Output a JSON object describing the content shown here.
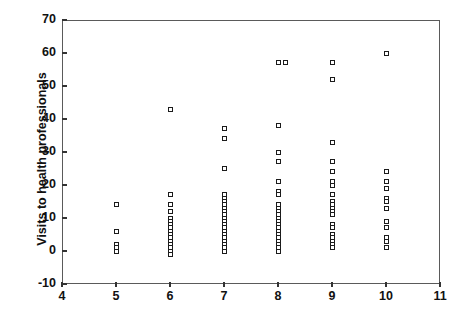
{
  "chart_data": {
    "type": "scatter",
    "title": "",
    "xlabel": "",
    "ylabel": "Visits to health professionals",
    "xlim": [
      4,
      11
    ],
    "ylim": [
      -10,
      70
    ],
    "xticks": [
      4,
      5,
      6,
      7,
      8,
      9,
      10,
      11
    ],
    "yticks": [
      -10,
      0,
      10,
      20,
      30,
      40,
      50,
      60,
      70
    ],
    "grid": false,
    "legend": false,
    "marker": "open-square",
    "marker_color": "#1b1b1b",
    "frame_color": "#5a5a5a",
    "background": "#ffffff",
    "note": "Jittered column scatter; points are stacked at integer x categories 5-10.",
    "points": [
      {
        "x": 5,
        "y": 14
      },
      {
        "x": 5,
        "y": 6
      },
      {
        "x": 5,
        "y": 2
      },
      {
        "x": 5,
        "y": 1
      },
      {
        "x": 5,
        "y": 0
      },
      {
        "x": 6,
        "y": 43
      },
      {
        "x": 6,
        "y": 17
      },
      {
        "x": 6,
        "y": 14
      },
      {
        "x": 6,
        "y": 12
      },
      {
        "x": 6,
        "y": 10
      },
      {
        "x": 6,
        "y": 9
      },
      {
        "x": 6,
        "y": 8
      },
      {
        "x": 6,
        "y": 7
      },
      {
        "x": 6,
        "y": 6
      },
      {
        "x": 6,
        "y": 5
      },
      {
        "x": 6,
        "y": 4
      },
      {
        "x": 6,
        "y": 3
      },
      {
        "x": 6,
        "y": 2
      },
      {
        "x": 6,
        "y": 1
      },
      {
        "x": 6,
        "y": 0
      },
      {
        "x": 6,
        "y": -1
      },
      {
        "x": 7,
        "y": 37
      },
      {
        "x": 7,
        "y": 34
      },
      {
        "x": 7,
        "y": 25
      },
      {
        "x": 7,
        "y": 17
      },
      {
        "x": 7,
        "y": 16
      },
      {
        "x": 7,
        "y": 15
      },
      {
        "x": 7,
        "y": 14
      },
      {
        "x": 7,
        "y": 13
      },
      {
        "x": 7,
        "y": 12
      },
      {
        "x": 7,
        "y": 11
      },
      {
        "x": 7,
        "y": 10
      },
      {
        "x": 7,
        "y": 9
      },
      {
        "x": 7,
        "y": 8
      },
      {
        "x": 7,
        "y": 7
      },
      {
        "x": 7,
        "y": 6
      },
      {
        "x": 7,
        "y": 5
      },
      {
        "x": 7,
        "y": 4
      },
      {
        "x": 7,
        "y": 3
      },
      {
        "x": 7,
        "y": 2
      },
      {
        "x": 7,
        "y": 1
      },
      {
        "x": 7,
        "y": 0
      },
      {
        "x": 8,
        "y": 57
      },
      {
        "x": 8,
        "y": 57
      },
      {
        "x": 8,
        "y": 38
      },
      {
        "x": 8,
        "y": 30
      },
      {
        "x": 8,
        "y": 27
      },
      {
        "x": 8,
        "y": 21
      },
      {
        "x": 8,
        "y": 18
      },
      {
        "x": 8,
        "y": 17
      },
      {
        "x": 8,
        "y": 14
      },
      {
        "x": 8,
        "y": 13
      },
      {
        "x": 8,
        "y": 12
      },
      {
        "x": 8,
        "y": 11
      },
      {
        "x": 8,
        "y": 10
      },
      {
        "x": 8,
        "y": 9
      },
      {
        "x": 8,
        "y": 8
      },
      {
        "x": 8,
        "y": 7
      },
      {
        "x": 8,
        "y": 6
      },
      {
        "x": 8,
        "y": 5
      },
      {
        "x": 8,
        "y": 4
      },
      {
        "x": 8,
        "y": 3
      },
      {
        "x": 8,
        "y": 2
      },
      {
        "x": 8,
        "y": 1
      },
      {
        "x": 8,
        "y": 0
      },
      {
        "x": 9,
        "y": 57
      },
      {
        "x": 9,
        "y": 52
      },
      {
        "x": 9,
        "y": 33
      },
      {
        "x": 9,
        "y": 27
      },
      {
        "x": 9,
        "y": 24
      },
      {
        "x": 9,
        "y": 21
      },
      {
        "x": 9,
        "y": 20
      },
      {
        "x": 9,
        "y": 17
      },
      {
        "x": 9,
        "y": 15
      },
      {
        "x": 9,
        "y": 14
      },
      {
        "x": 9,
        "y": 13
      },
      {
        "x": 9,
        "y": 12
      },
      {
        "x": 9,
        "y": 11
      },
      {
        "x": 9,
        "y": 8
      },
      {
        "x": 9,
        "y": 7
      },
      {
        "x": 9,
        "y": 5
      },
      {
        "x": 9,
        "y": 4
      },
      {
        "x": 9,
        "y": 3
      },
      {
        "x": 9,
        "y": 2
      },
      {
        "x": 9,
        "y": 1
      },
      {
        "x": 10,
        "y": 60
      },
      {
        "x": 10,
        "y": 24
      },
      {
        "x": 10,
        "y": 21
      },
      {
        "x": 10,
        "y": 19
      },
      {
        "x": 10,
        "y": 16
      },
      {
        "x": 10,
        "y": 15
      },
      {
        "x": 10,
        "y": 13
      },
      {
        "x": 10,
        "y": 9
      },
      {
        "x": 10,
        "y": 7
      },
      {
        "x": 10,
        "y": 4
      },
      {
        "x": 10,
        "y": 3
      },
      {
        "x": 10,
        "y": 1
      }
    ]
  }
}
